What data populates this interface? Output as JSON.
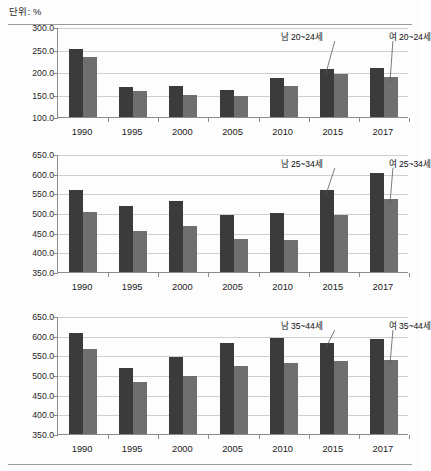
{
  "header": {
    "unit_label": "단위: %"
  },
  "chart_data": [
    {
      "type": "bar",
      "title": "",
      "xlabel": "",
      "ylabel": "",
      "unit": "%",
      "categories": [
        "1990",
        "1995",
        "2000",
        "2005",
        "2010",
        "2015",
        "2017"
      ],
      "ylim": [
        100.0,
        300.0
      ],
      "yticks": [
        "100.0",
        "150.0",
        "200.0",
        "250.0",
        "300.0"
      ],
      "ytick_values": [
        100.0,
        150.0,
        200.0,
        250.0,
        300.0
      ],
      "grid": true,
      "legend_position": "annotation",
      "series": [
        {
          "name": "남 20~24세",
          "color": "#3b3b3b",
          "values": [
            252.0,
            166.0,
            168.0,
            160.0,
            187.0,
            207.0,
            208.0
          ]
        },
        {
          "name": "여 20~24세",
          "color": "#6f6f6f",
          "values": [
            234.0,
            158.0,
            149.0,
            146.0,
            170.0,
            195.0,
            188.0
          ]
        }
      ],
      "annotations": [
        {
          "text": "남 20~24세",
          "target_series": 0,
          "target_category": "2015"
        },
        {
          "text": "여 20~24세",
          "target_series": 1,
          "target_category": "2017"
        }
      ]
    },
    {
      "type": "bar",
      "title": "",
      "xlabel": "",
      "ylabel": "",
      "unit": "%",
      "categories": [
        "1990",
        "1995",
        "2000",
        "2005",
        "2010",
        "2015",
        "2017"
      ],
      "ylim": [
        350.0,
        650.0
      ],
      "yticks": [
        "350.0",
        "400.0",
        "450.0",
        "500.0",
        "550.0",
        "600.0",
        "650.0"
      ],
      "ytick_values": [
        350.0,
        400.0,
        450.0,
        500.0,
        550.0,
        600.0,
        650.0
      ],
      "grid": true,
      "legend_position": "annotation",
      "series": [
        {
          "name": "남 25~34세",
          "color": "#3b3b3b",
          "values": [
            558.0,
            517.0,
            530.0,
            494.0,
            499.0,
            558.0,
            602.0
          ]
        },
        {
          "name": "여 25~34세",
          "color": "#6f6f6f",
          "values": [
            502.0,
            455.0,
            466.0,
            434.0,
            431.0,
            495.0,
            536.0
          ]
        }
      ],
      "annotations": [
        {
          "text": "남 25~34세",
          "target_series": 0,
          "target_category": "2015"
        },
        {
          "text": "여 25~34세",
          "target_series": 1,
          "target_category": "2017"
        }
      ]
    },
    {
      "type": "bar",
      "title": "",
      "xlabel": "",
      "ylabel": "",
      "unit": "%",
      "categories": [
        "1990",
        "1995",
        "2000",
        "2005",
        "2010",
        "2015",
        "2017"
      ],
      "ylim": [
        350.0,
        650.0
      ],
      "yticks": [
        "350.0",
        "400.0",
        "450.0",
        "500.0",
        "550.0",
        "600.0",
        "650.0"
      ],
      "ytick_values": [
        350.0,
        400.0,
        450.0,
        500.0,
        550.0,
        600.0,
        650.0
      ],
      "grid": true,
      "legend_position": "annotation",
      "series": [
        {
          "name": "남 35~44세",
          "color": "#3b3b3b",
          "values": [
            607.0,
            518.0,
            547.0,
            581.0,
            593.0,
            582.0,
            592.0
          ]
        },
        {
          "name": "여 35~44세",
          "color": "#6f6f6f",
          "values": [
            565.0,
            483.0,
            497.0,
            522.0,
            531.0,
            535.0,
            539.0
          ]
        }
      ],
      "annotations": [
        {
          "text": "남 35~44세",
          "target_series": 0,
          "target_category": "2015"
        },
        {
          "text": "여 35~44세",
          "target_series": 1,
          "target_category": "2017"
        }
      ]
    }
  ]
}
